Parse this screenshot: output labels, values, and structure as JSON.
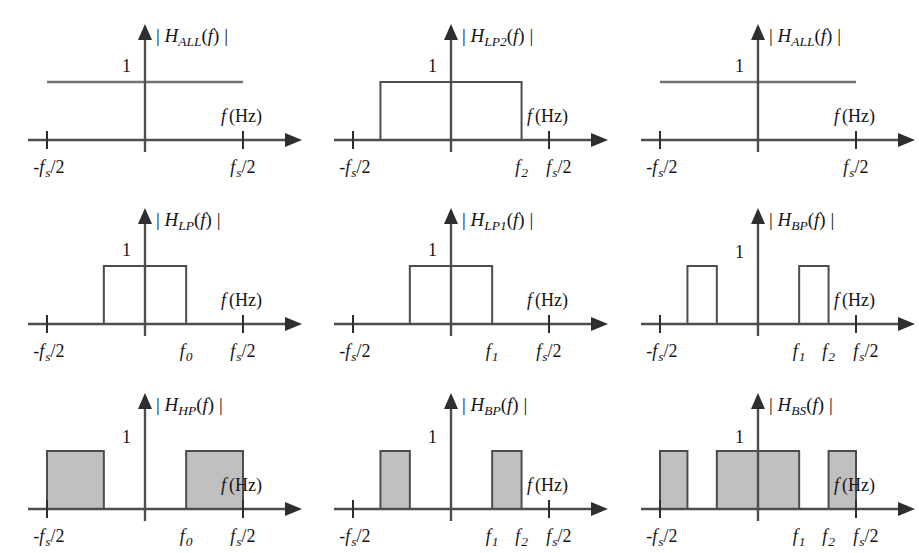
{
  "figure": {
    "background": "#ffffff",
    "fill_color": "#c0c0c0",
    "stroke_color": "#4d4d4d",
    "axis_color": "#4d4d4d",
    "rows": 3,
    "cols": 3
  },
  "labels": {
    "amplitude_one": "1",
    "axis_f": "f",
    "axis_hz": "(Hz)",
    "bar_left": "|",
    "bar_right": "|",
    "paren_open": "(",
    "paren_close": ")",
    "tick_neg_half": "-f",
    "tick_neg_half_sub": "s",
    "tick_neg_half_tail": "/2",
    "tick_pos_half": "f",
    "tick_pos_half_sub": "s",
    "tick_pos_half_tail": "/2",
    "f0": "f",
    "f0_sub": "0",
    "f1": "f",
    "f1_sub": "1",
    "f2": "f",
    "f2_sub": "2"
  },
  "panels": [
    {
      "id": "panel-1",
      "position": "row1-col1",
      "title_H": "H",
      "title_sub": "ALL",
      "title_arg": "f",
      "title_full": "| H_ALL(f) |",
      "filter_type": "all-pass",
      "filled": false,
      "ticks": [
        "-f_s/2",
        "f_s/2"
      ],
      "response": "flat",
      "bands": [
        {
          "from": "-f_s/2",
          "to": "f_s/2",
          "height": 1
        }
      ]
    },
    {
      "id": "panel-2",
      "position": "row1-col2",
      "title_H": "H",
      "title_sub": "LP2",
      "title_arg": "f",
      "title_full": "| H_LP2(f) |",
      "filter_type": "low-pass-2",
      "filled": false,
      "ticks": [
        "-f_s/2",
        "f_2",
        "f_s/2"
      ],
      "response": "rect",
      "bands": [
        {
          "from": "-f_2",
          "to": "f_2",
          "height": 1
        }
      ]
    },
    {
      "id": "panel-3",
      "position": "row1-col3",
      "title_H": "H",
      "title_sub": "ALL",
      "title_arg": "f",
      "title_full": "| H_ALL(f) |",
      "filter_type": "all-pass",
      "filled": false,
      "ticks": [
        "-f_s/2",
        "f_s/2"
      ],
      "response": "flat",
      "bands": [
        {
          "from": "-f_s/2",
          "to": "f_s/2",
          "height": 1
        }
      ]
    },
    {
      "id": "panel-4",
      "position": "row2-col1",
      "title_H": "H",
      "title_sub": "LP",
      "title_arg": "f",
      "title_full": "| H_LP(f) |",
      "filter_type": "low-pass",
      "filled": false,
      "ticks": [
        "-f_s/2",
        "f_0",
        "f_s/2"
      ],
      "response": "rect",
      "bands": [
        {
          "from": "-f_0",
          "to": "f_0",
          "height": 1
        }
      ]
    },
    {
      "id": "panel-5",
      "position": "row2-col2",
      "title_H": "H",
      "title_sub": "LP1",
      "title_arg": "f",
      "title_full": "| H_LP1(f) |",
      "filter_type": "low-pass-1",
      "filled": false,
      "ticks": [
        "-f_s/2",
        "f_1",
        "f_s/2"
      ],
      "response": "rect",
      "bands": [
        {
          "from": "-f_1",
          "to": "f_1",
          "height": 1
        }
      ]
    },
    {
      "id": "panel-6",
      "position": "row2-col3",
      "title_H": "H",
      "title_sub": "BP",
      "title_arg": "f",
      "title_full": "| H_BP(f) |",
      "filter_type": "band-pass",
      "filled": false,
      "ticks": [
        "-f_s/2",
        "f_1",
        "f_2",
        "f_s/2"
      ],
      "response": "two-bands",
      "bands": [
        {
          "from": "-f_2",
          "to": "-f_1",
          "height": 1
        },
        {
          "from": "f_1",
          "to": "f_2",
          "height": 1
        }
      ]
    },
    {
      "id": "panel-7",
      "position": "row3-col1",
      "title_H": "H",
      "title_sub": "HP",
      "title_arg": "f",
      "title_full": "| H_HP(f) |",
      "filter_type": "high-pass",
      "filled": true,
      "ticks": [
        "-f_s/2",
        "f_0",
        "f_s/2"
      ],
      "response": "two-bands",
      "bands": [
        {
          "from": "-f_s/2",
          "to": "-f_0",
          "height": 1
        },
        {
          "from": "f_0",
          "to": "f_s/2",
          "height": 1
        }
      ]
    },
    {
      "id": "panel-8",
      "position": "row3-col2",
      "title_H": "H",
      "title_sub": "BP",
      "title_arg": "f",
      "title_full": "| H_BP(f) |",
      "filter_type": "band-pass",
      "filled": true,
      "ticks": [
        "-f_s/2",
        "f_1",
        "f_2",
        "f_s/2"
      ],
      "response": "two-bands",
      "bands": [
        {
          "from": "-f_2",
          "to": "-f_1",
          "height": 1
        },
        {
          "from": "f_1",
          "to": "f_2",
          "height": 1
        }
      ]
    },
    {
      "id": "panel-9",
      "position": "row3-col3",
      "title_H": "H",
      "title_sub": "BS",
      "title_arg": "f",
      "title_full": "| H_BS(f) |",
      "filter_type": "band-stop",
      "filled": true,
      "ticks": [
        "-f_s/2",
        "f_1",
        "f_2",
        "f_s/2"
      ],
      "response": "three-bands",
      "bands": [
        {
          "from": "-f_s/2",
          "to": "-f_2",
          "height": 1
        },
        {
          "from": "-f_1",
          "to": "f_1",
          "height": 1
        },
        {
          "from": "f_2",
          "to": "f_s/2",
          "height": 1
        }
      ]
    }
  ],
  "chart_data": {
    "type": "line",
    "xlabel": "f (Hz)",
    "ylabel": "|H(f)|",
    "xlim": [
      "-fs/2",
      "fs/2"
    ],
    "ylim": [
      0,
      1.15
    ],
    "grid": false,
    "legend": "none",
    "subplots": [
      {
        "title": "|H_ALL(f)|",
        "passbands": [
          [
            -0.5,
            0.5
          ]
        ],
        "gain": 1,
        "xticks": [
          "-fs/2",
          "fs/2"
        ],
        "xtickvalues": [
          -0.5,
          0.5
        ],
        "shaded": false
      },
      {
        "title": "|H_LP2(f)|",
        "passbands": [
          [
            -0.36,
            0.36
          ]
        ],
        "gain": 1,
        "xticks": [
          "-fs/2",
          "f2",
          "fs/2"
        ],
        "xtickvalues": [
          -0.5,
          0.36,
          0.5
        ],
        "shaded": false
      },
      {
        "title": "|H_ALL(f)|",
        "passbands": [
          [
            -0.5,
            0.5
          ]
        ],
        "gain": 1,
        "xticks": [
          "-fs/2",
          "fs/2"
        ],
        "xtickvalues": [
          -0.5,
          0.5
        ],
        "shaded": false
      },
      {
        "title": "|H_LP(f)|",
        "passbands": [
          [
            -0.21,
            0.21
          ]
        ],
        "gain": 1,
        "xticks": [
          "-fs/2",
          "f0",
          "fs/2"
        ],
        "xtickvalues": [
          -0.5,
          0.21,
          0.5
        ],
        "shaded": false
      },
      {
        "title": "|H_LP1(f)|",
        "passbands": [
          [
            -0.21,
            0.21
          ]
        ],
        "gain": 1,
        "xticks": [
          "-fs/2",
          "f1",
          "fs/2"
        ],
        "xtickvalues": [
          -0.5,
          0.21,
          0.5
        ],
        "shaded": false
      },
      {
        "title": "|H_BP(f)|",
        "passbands": [
          [
            -0.36,
            -0.21
          ],
          [
            0.21,
            0.36
          ]
        ],
        "gain": 1,
        "xticks": [
          "-fs/2",
          "f1",
          "f2",
          "fs/2"
        ],
        "xtickvalues": [
          -0.5,
          0.21,
          0.36,
          0.5
        ],
        "shaded": false
      },
      {
        "title": "|H_HP(f)|",
        "passbands": [
          [
            -0.5,
            -0.21
          ],
          [
            0.21,
            0.5
          ]
        ],
        "gain": 1,
        "xticks": [
          "-fs/2",
          "f0",
          "fs/2"
        ],
        "xtickvalues": [
          -0.5,
          0.21,
          0.5
        ],
        "shaded": true
      },
      {
        "title": "|H_BP(f)|",
        "passbands": [
          [
            -0.36,
            -0.21
          ],
          [
            0.21,
            0.36
          ]
        ],
        "gain": 1,
        "xticks": [
          "-fs/2",
          "f1",
          "f2",
          "fs/2"
        ],
        "xtickvalues": [
          -0.5,
          0.21,
          0.36,
          0.5
        ],
        "shaded": true
      },
      {
        "title": "|H_BS(f)|",
        "passbands": [
          [
            -0.5,
            -0.36
          ],
          [
            -0.21,
            0.21
          ],
          [
            0.36,
            0.5
          ]
        ],
        "gain": 1,
        "xticks": [
          "-fs/2",
          "f1",
          "f2",
          "fs/2"
        ],
        "xtickvalues": [
          -0.5,
          0.21,
          0.36,
          0.5
        ],
        "shaded": true
      }
    ]
  }
}
